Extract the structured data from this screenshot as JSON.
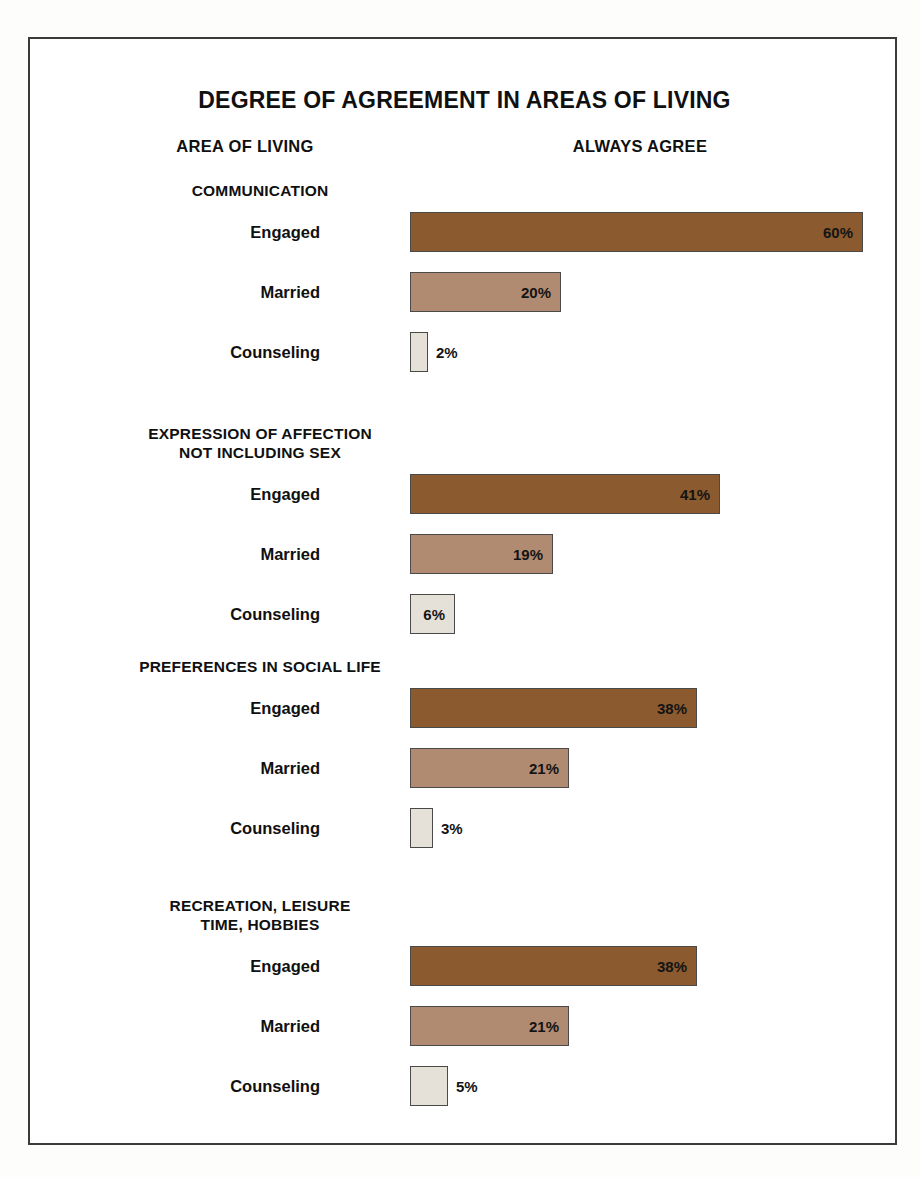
{
  "chart_data": {
    "type": "bar",
    "title": "DEGREE OF AGREEMENT IN AREAS OF LIVING",
    "orientation": "horizontal",
    "xlabel": "",
    "ylabel": "",
    "unit": "%",
    "grid": false,
    "legend_position": "none",
    "column_headers": [
      "AREA OF LIVING",
      "ALWAYS AGREE"
    ],
    "series_names": [
      "Engaged",
      "Married",
      "Counseling"
    ],
    "categories": [
      "COMMUNICATION",
      "EXPRESSION OF AFFECTION NOT INCLUDING SEX",
      "PREFERENCES IN SOCIAL LIFE",
      "RECREATION, LEISURE TIME, HOBBIES"
    ],
    "series": [
      {
        "name": "Engaged",
        "values": [
          60,
          41,
          38,
          38
        ]
      },
      {
        "name": "Married",
        "values": [
          20,
          19,
          21,
          21
        ]
      },
      {
        "name": "Counseling",
        "values": [
          2,
          6,
          3,
          5
        ]
      }
    ],
    "xlim": [
      0,
      60
    ]
  },
  "header": {
    "title": "DEGREE OF AGREEMENT IN AREAS OF LIVING",
    "col_area": "AREA OF LIVING",
    "col_value": "ALWAYS AGREE"
  },
  "colors": {
    "engaged": "#8b5a2e",
    "married": "#b08b71",
    "counseling": "#e6e1d8",
    "border": "#3b3b3b",
    "text": "#101010",
    "background": "#ffffff"
  },
  "groups": [
    {
      "title": "COMMUNICATION",
      "rows": [
        {
          "label": "Engaged",
          "value": "60%"
        },
        {
          "label": "Married",
          "value": "20%"
        },
        {
          "label": "Counseling",
          "value": "2%"
        }
      ]
    },
    {
      "title": "EXPRESSION OF AFFECTION\nNOT INCLUDING SEX",
      "rows": [
        {
          "label": "Engaged",
          "value": "41%"
        },
        {
          "label": "Married",
          "value": "19%"
        },
        {
          "label": "Counseling",
          "value": "6%"
        }
      ]
    },
    {
      "title": "PREFERENCES IN SOCIAL LIFE",
      "rows": [
        {
          "label": "Engaged",
          "value": "38%"
        },
        {
          "label": "Married",
          "value": "21%"
        },
        {
          "label": "Counseling",
          "value": "3%"
        }
      ]
    },
    {
      "title": "RECREATION, LEISURE\nTIME, HOBBIES",
      "rows": [
        {
          "label": "Engaged",
          "value": "38%"
        },
        {
          "label": "Married",
          "value": "21%"
        },
        {
          "label": "Counseling",
          "value": "5%"
        }
      ]
    }
  ]
}
